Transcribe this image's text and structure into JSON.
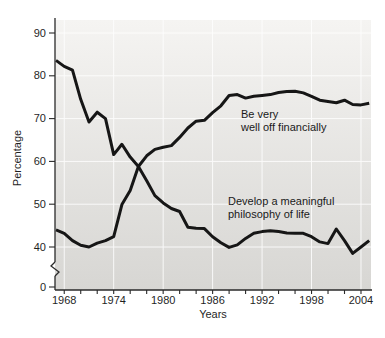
{
  "figure": {
    "ylabel": "Percentage",
    "xlabel": "Years"
  },
  "style": {
    "line_color": "#161616",
    "grid_color": "#ffffff",
    "plot_bg_top": "#f5f4f2",
    "plot_bg_bottom": "#d7d6d3",
    "axis_color": "#2a2a2a",
    "text_color": "#1f1f1f",
    "page_bg": "#ffffff"
  },
  "chart_data": {
    "type": "line",
    "title": "",
    "xlabel": "Years",
    "ylabel": "Percentage",
    "grid": true,
    "legend_position": "inline-annotations",
    "ylim": [
      0,
      95
    ],
    "y_axis_break_between": [
      0,
      40
    ],
    "x_tick_labels": [
      1968,
      1974,
      1980,
      1986,
      1992,
      1998,
      2004
    ],
    "x_minor_tick_step": 2,
    "y_tick_labels": [
      90,
      80,
      70,
      60,
      50,
      40
    ],
    "y_zero_label": "0",
    "x": [
      1967,
      1968,
      1969,
      1970,
      1971,
      1972,
      1973,
      1974,
      1975,
      1976,
      1977,
      1978,
      1979,
      1980,
      1981,
      1982,
      1983,
      1984,
      1985,
      1986,
      1987,
      1988,
      1989,
      1990,
      1991,
      1992,
      1993,
      1994,
      1995,
      1996,
      1997,
      1998,
      1999,
      2000,
      2001,
      2002,
      2003,
      2004,
      2005
    ],
    "series": [
      {
        "name": "Be very well off financially",
        "values": [
          44.0,
          43.2,
          41.5,
          40.4,
          40.0,
          40.9,
          41.5,
          42.4,
          49.9,
          53.2,
          58.8,
          61.3,
          62.8,
          63.3,
          63.7,
          65.6,
          67.8,
          69.4,
          69.6,
          71.4,
          73.0,
          75.4,
          75.6,
          74.8,
          75.2,
          75.4,
          75.6,
          76.1,
          76.3,
          76.4,
          76.0,
          75.2,
          74.3,
          74.0,
          73.7,
          74.3,
          73.3,
          73.2,
          73.6
        ]
      },
      {
        "name": "Develop a meaningful philosophy of life",
        "values": [
          83.6,
          82.2,
          81.3,
          74.5,
          69.2,
          71.5,
          70.0,
          61.6,
          64.0,
          61.0,
          58.8,
          55.5,
          52.0,
          50.3,
          49.0,
          48.3,
          44.6,
          44.4,
          44.3,
          42.4,
          41.0,
          39.9,
          40.5,
          42.0,
          43.2,
          43.6,
          43.8,
          43.6,
          43.3,
          43.2,
          43.2,
          42.4,
          41.2,
          40.8,
          44.2,
          41.5,
          38.5,
          40.0,
          41.5
        ]
      }
    ],
    "annotations": [
      {
        "lines": [
          "Be very",
          "well off financially"
        ]
      },
      {
        "lines": [
          "Develop a meaningful",
          "philosophy of life"
        ]
      }
    ]
  }
}
